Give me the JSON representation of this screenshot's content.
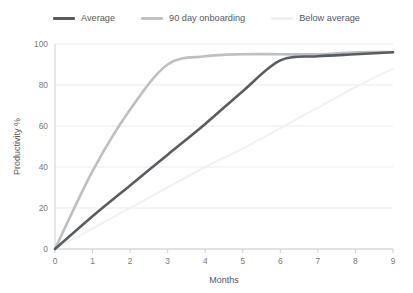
{
  "chart_data": {
    "type": "line",
    "title": "",
    "xlabel": "Months",
    "ylabel": "Productivity %",
    "xlim": [
      0,
      9
    ],
    "ylim": [
      0,
      100
    ],
    "xticks": [
      "0",
      "1",
      "2",
      "3",
      "4",
      "5",
      "6",
      "7",
      "8",
      "9"
    ],
    "yticks": [
      "0",
      "20",
      "40",
      "60",
      "80",
      "100"
    ],
    "grid": "horizontal",
    "legend_position": "top-center",
    "x": [
      0,
      1,
      2,
      3,
      4,
      5,
      6,
      7,
      8,
      9
    ],
    "series": [
      {
        "name": "Average",
        "color": "#595d61",
        "values": [
          0,
          16,
          31,
          46,
          61,
          77,
          92,
          94,
          95,
          96
        ]
      },
      {
        "name": "90 day onboarding",
        "color": "#bcc0c4",
        "values": [
          0,
          38,
          68,
          90,
          94,
          95,
          95,
          95,
          96,
          96
        ]
      },
      {
        "name": "Below average",
        "color": "#f0f1f2",
        "values": [
          0,
          10,
          20,
          30,
          40,
          49,
          59,
          69,
          79,
          88
        ]
      }
    ]
  },
  "legend": {
    "entries": [
      {
        "label": "Average"
      },
      {
        "label": "90 day onboarding"
      },
      {
        "label": "Below average"
      }
    ]
  },
  "axes": {
    "x_title": "Months",
    "y_title": "Productivity %"
  },
  "colors": {
    "background": "#ffffff",
    "grid": "#e4e6e8",
    "axis": "#c9ccd0",
    "tick_label": "#76797d",
    "axis_title": "#55585c"
  }
}
